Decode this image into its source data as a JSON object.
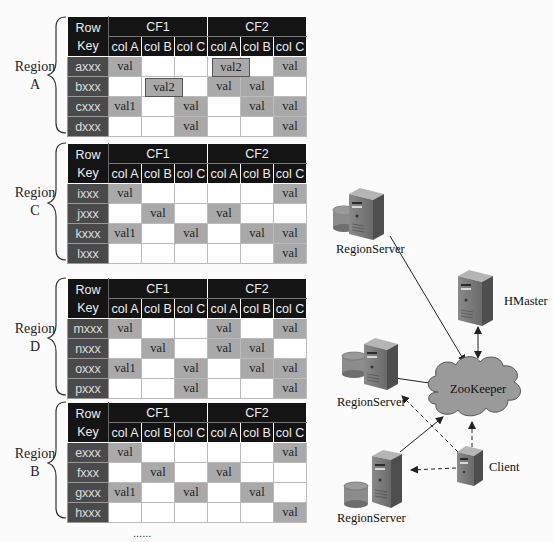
{
  "header": {
    "row_key_line1": "Row",
    "row_key_line2": "Key",
    "cf1": "CF1",
    "cf2": "CF2",
    "columns": [
      "col A",
      "col B",
      "col C",
      "col A",
      "col B",
      "col C"
    ]
  },
  "regions": [
    {
      "label_line1": "Region",
      "label_line2": "A",
      "rows": [
        {
          "key": "axxx",
          "cells": [
            "val",
            "",
            "",
            "val2",
            "",
            "val"
          ]
        },
        {
          "key": "bxxx",
          "cells": [
            "",
            "val2",
            "",
            "val",
            "val",
            ""
          ]
        },
        {
          "key": "cxxx",
          "cells": [
            "val1",
            "",
            "val",
            "",
            "val",
            "val"
          ]
        },
        {
          "key": "dxxx",
          "cells": [
            "",
            "",
            "val",
            "",
            "",
            "val"
          ]
        }
      ]
    },
    {
      "label_line1": "Region",
      "label_line2": "C",
      "rows": [
        {
          "key": "ixxx",
          "cells": [
            "val",
            "",
            "",
            "",
            "",
            "val"
          ]
        },
        {
          "key": "jxxx",
          "cells": [
            "",
            "val",
            "",
            "val",
            "",
            ""
          ]
        },
        {
          "key": "kxxx",
          "cells": [
            "val1",
            "",
            "val",
            "",
            "val",
            "val"
          ]
        },
        {
          "key": "lxxx",
          "cells": [
            "",
            "",
            "",
            "",
            "",
            "val"
          ]
        }
      ]
    },
    {
      "label_line1": "Region",
      "label_line2": "D",
      "rows": [
        {
          "key": "mxxx",
          "cells": [
            "val",
            "",
            "",
            "val",
            "",
            "val"
          ]
        },
        {
          "key": "nxxx",
          "cells": [
            "",
            "val",
            "",
            "val",
            "val",
            ""
          ]
        },
        {
          "key": "oxxx",
          "cells": [
            "val1",
            "",
            "val",
            "",
            "val",
            "val"
          ]
        },
        {
          "key": "pxxx",
          "cells": [
            "",
            "",
            "val",
            "",
            "",
            "val"
          ]
        }
      ]
    },
    {
      "label_line1": "Region",
      "label_line2": "B",
      "rows": [
        {
          "key": "exxx",
          "cells": [
            "val",
            "",
            "",
            "",
            "",
            "val"
          ]
        },
        {
          "key": "fxxx",
          "cells": [
            "",
            "val",
            "",
            "val",
            "",
            ""
          ]
        },
        {
          "key": "gxxx",
          "cells": [
            "val1",
            "",
            "val",
            "",
            "val",
            ""
          ]
        },
        {
          "key": "hxxx",
          "cells": [
            "",
            "",
            "",
            "",
            "",
            "val"
          ]
        }
      ]
    }
  ],
  "ellipsis": "......",
  "diagram": {
    "nodes": {
      "regionserver_1": "RegionServer",
      "regionserver_2": "RegionServer",
      "regionserver_3": "RegionServer",
      "hmaster": "HMaster",
      "zookeeper": "ZooKeeper",
      "client": "Client"
    },
    "colors": {
      "cell_filled": "#a9a9a9",
      "header_bg": "#141414",
      "rowkey_bg": "#4a4a4a",
      "cloud": "#9a9a9a"
    }
  }
}
